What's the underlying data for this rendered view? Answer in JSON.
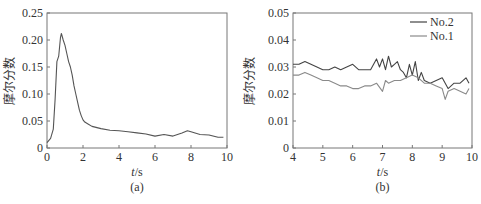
{
  "chart_data": [
    {
      "type": "line",
      "panel_label": "(a)",
      "title": "",
      "xlabel": "t/s",
      "ylabel": "摩尔分数",
      "xlim": [
        0,
        10
      ],
      "ylim": [
        0,
        0.25
      ],
      "xticks": [
        "0",
        "2",
        "4",
        "6",
        "8",
        "10"
      ],
      "yticks": [
        "0",
        "0.05",
        "0.10",
        "0.15",
        "0.20",
        "0.25"
      ],
      "grid": false,
      "legend": null,
      "series": [
        {
          "name": "",
          "color": "#555555",
          "x": [
            0,
            0.2,
            0.35,
            0.45,
            0.55,
            0.65,
            0.75,
            0.8,
            0.9,
            1.0,
            1.1,
            1.2,
            1.3,
            1.4,
            1.5,
            1.6,
            1.7,
            1.8,
            1.9,
            2.0,
            2.1,
            2.3,
            2.5,
            3.0,
            3.5,
            4.0,
            4.5,
            5.0,
            5.5,
            6.0,
            6.5,
            7.0,
            7.5,
            7.8,
            8.0,
            8.5,
            9.0,
            9.5,
            9.8
          ],
          "y": [
            0.01,
            0.018,
            0.035,
            0.09,
            0.16,
            0.17,
            0.205,
            0.212,
            0.2,
            0.19,
            0.175,
            0.16,
            0.15,
            0.135,
            0.115,
            0.1,
            0.085,
            0.07,
            0.06,
            0.052,
            0.048,
            0.044,
            0.04,
            0.036,
            0.033,
            0.032,
            0.03,
            0.028,
            0.026,
            0.022,
            0.025,
            0.022,
            0.028,
            0.032,
            0.03,
            0.025,
            0.024,
            0.02,
            0.02
          ]
        }
      ]
    },
    {
      "type": "line",
      "panel_label": "(b)",
      "title": "",
      "xlabel": "t/s",
      "ylabel": "摩尔分数",
      "xlim": [
        4,
        10
      ],
      "ylim": [
        0,
        0.05
      ],
      "xticks": [
        "4",
        "5",
        "6",
        "7",
        "8",
        "9",
        "10"
      ],
      "yticks": [
        "0",
        "0.01",
        "0.02",
        "0.03",
        "0.04",
        "0.05"
      ],
      "grid": false,
      "legend": {
        "position": "upper right",
        "entries": [
          "No.2",
          "No.1"
        ]
      },
      "series": [
        {
          "name": "No.2",
          "color": "#444444",
          "x": [
            4.0,
            4.2,
            4.4,
            4.6,
            4.8,
            5.0,
            5.2,
            5.4,
            5.6,
            5.8,
            6.0,
            6.2,
            6.4,
            6.6,
            6.8,
            6.9,
            7.0,
            7.1,
            7.2,
            7.3,
            7.4,
            7.5,
            7.6,
            7.7,
            7.8,
            7.9,
            8.0,
            8.1,
            8.2,
            8.3,
            8.4,
            8.6,
            8.8,
            9.0,
            9.2,
            9.4,
            9.6,
            9.8,
            9.9
          ],
          "y": [
            0.031,
            0.031,
            0.032,
            0.031,
            0.03,
            0.029,
            0.029,
            0.03,
            0.029,
            0.03,
            0.031,
            0.029,
            0.029,
            0.029,
            0.033,
            0.03,
            0.033,
            0.029,
            0.034,
            0.03,
            0.031,
            0.032,
            0.029,
            0.028,
            0.026,
            0.031,
            0.027,
            0.032,
            0.025,
            0.028,
            0.025,
            0.024,
            0.025,
            0.026,
            0.022,
            0.024,
            0.024,
            0.026,
            0.024
          ]
        },
        {
          "name": "No.1",
          "color": "#8a8a8a",
          "x": [
            4.0,
            4.2,
            4.4,
            4.6,
            4.8,
            5.0,
            5.2,
            5.4,
            5.6,
            5.8,
            6.0,
            6.2,
            6.4,
            6.6,
            6.8,
            7.0,
            7.1,
            7.2,
            7.4,
            7.6,
            7.8,
            8.0,
            8.2,
            8.4,
            8.6,
            8.8,
            9.0,
            9.1,
            9.2,
            9.4,
            9.6,
            9.8,
            9.9
          ],
          "y": [
            0.027,
            0.027,
            0.028,
            0.027,
            0.026,
            0.025,
            0.025,
            0.024,
            0.023,
            0.023,
            0.022,
            0.022,
            0.023,
            0.023,
            0.024,
            0.021,
            0.025,
            0.024,
            0.025,
            0.025,
            0.026,
            0.027,
            0.026,
            0.024,
            0.024,
            0.023,
            0.022,
            0.018,
            0.021,
            0.022,
            0.021,
            0.02,
            0.022
          ]
        }
      ]
    }
  ]
}
